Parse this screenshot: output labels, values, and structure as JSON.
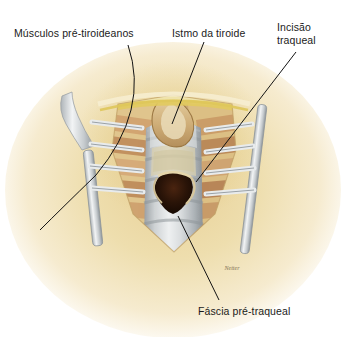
{
  "figure": {
    "kind": "anatomical-illustration",
    "background_color": "#ffffff",
    "label_color": "#1b1b1b",
    "leader_color": "#131313",
    "signature": "Netter"
  },
  "labels": {
    "muscles": "Músculos pré-tiroideanos",
    "isthmus": "Istmo da tiroide",
    "incision_line1": "Incisão",
    "incision_line2": "traqueal",
    "fascia": "Fáscia pré-traqueal"
  },
  "palette": {
    "skin_light": "#f3e3bd",
    "skin_mid": "#e8d39b",
    "skin_deep": "#d9bd78",
    "fat_yellow": "#efe09a",
    "fascia_yellow": "#e4cf62",
    "muscle_tan": "#d4a877",
    "muscle_dark": "#b9815a",
    "trachea_gray": "#c9ccce",
    "trachea_light": "#e4e6e7",
    "trachea_shadow": "#9aa0a4",
    "lumen_dark": "#2a1408",
    "metal_light": "#e9ecee",
    "metal_dark": "#8d949a",
    "isthmus_tan": "#d8bd8c"
  },
  "structures": [
    {
      "name": "pre-thyroid-muscles",
      "label_ref": "muscles"
    },
    {
      "name": "thyroid-isthmus",
      "label_ref": "isthmus"
    },
    {
      "name": "tracheal-incision",
      "label_ref": "incision_line1"
    },
    {
      "name": "pretracheal-fascia",
      "label_ref": "fascia"
    },
    {
      "name": "left-retractor",
      "label_ref": null
    },
    {
      "name": "right-retractor",
      "label_ref": null
    }
  ]
}
